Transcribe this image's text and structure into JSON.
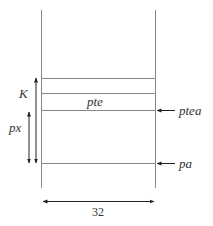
{
  "diagram": {
    "labels": {
      "k": "K",
      "px": "px",
      "pte": "pte",
      "ptea": "ptea",
      "pa": "pa",
      "width": "32"
    },
    "colors": {
      "line": "#888888",
      "text": "#333333",
      "arrow": "#222222"
    }
  }
}
